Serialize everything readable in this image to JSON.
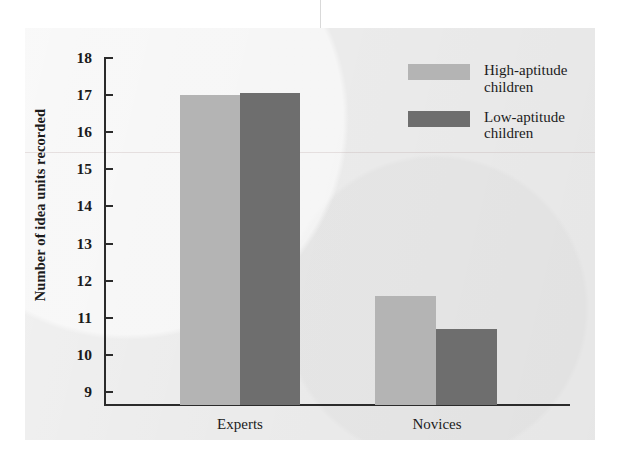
{
  "chart_data": {
    "type": "bar",
    "title": "",
    "xlabel": "",
    "ylabel": "Number of idea units recorded",
    "categories": [
      "Experts",
      "Novices"
    ],
    "ylim": [
      8.65,
      18
    ],
    "yticks": [
      9,
      10,
      11,
      12,
      13,
      14,
      15,
      16,
      17,
      18
    ],
    "ytick_labels": [
      "9",
      "10",
      "11",
      "12",
      "13",
      "14",
      "15",
      "16",
      "17",
      "18"
    ],
    "grid": false,
    "legend_position": "top-right",
    "series": [
      {
        "name": "High-aptitude children",
        "legend_label": "High-aptitude\nchildren",
        "color": "#b4b4b4",
        "values": [
          17.0,
          11.6
        ]
      },
      {
        "name": "Low-aptitude children",
        "legend_label": "Low-aptitude\nchildren",
        "color": "#6e6e6e",
        "values": [
          17.05,
          10.7
        ]
      }
    ]
  },
  "colors": {
    "plate_background": "#ebebeb",
    "page_background": "#ffffff",
    "axis": "#2b2b2b",
    "text": "#1b1b1b",
    "high_aptitude": "#b4b4b4",
    "low_aptitude": "#6e6e6e"
  }
}
